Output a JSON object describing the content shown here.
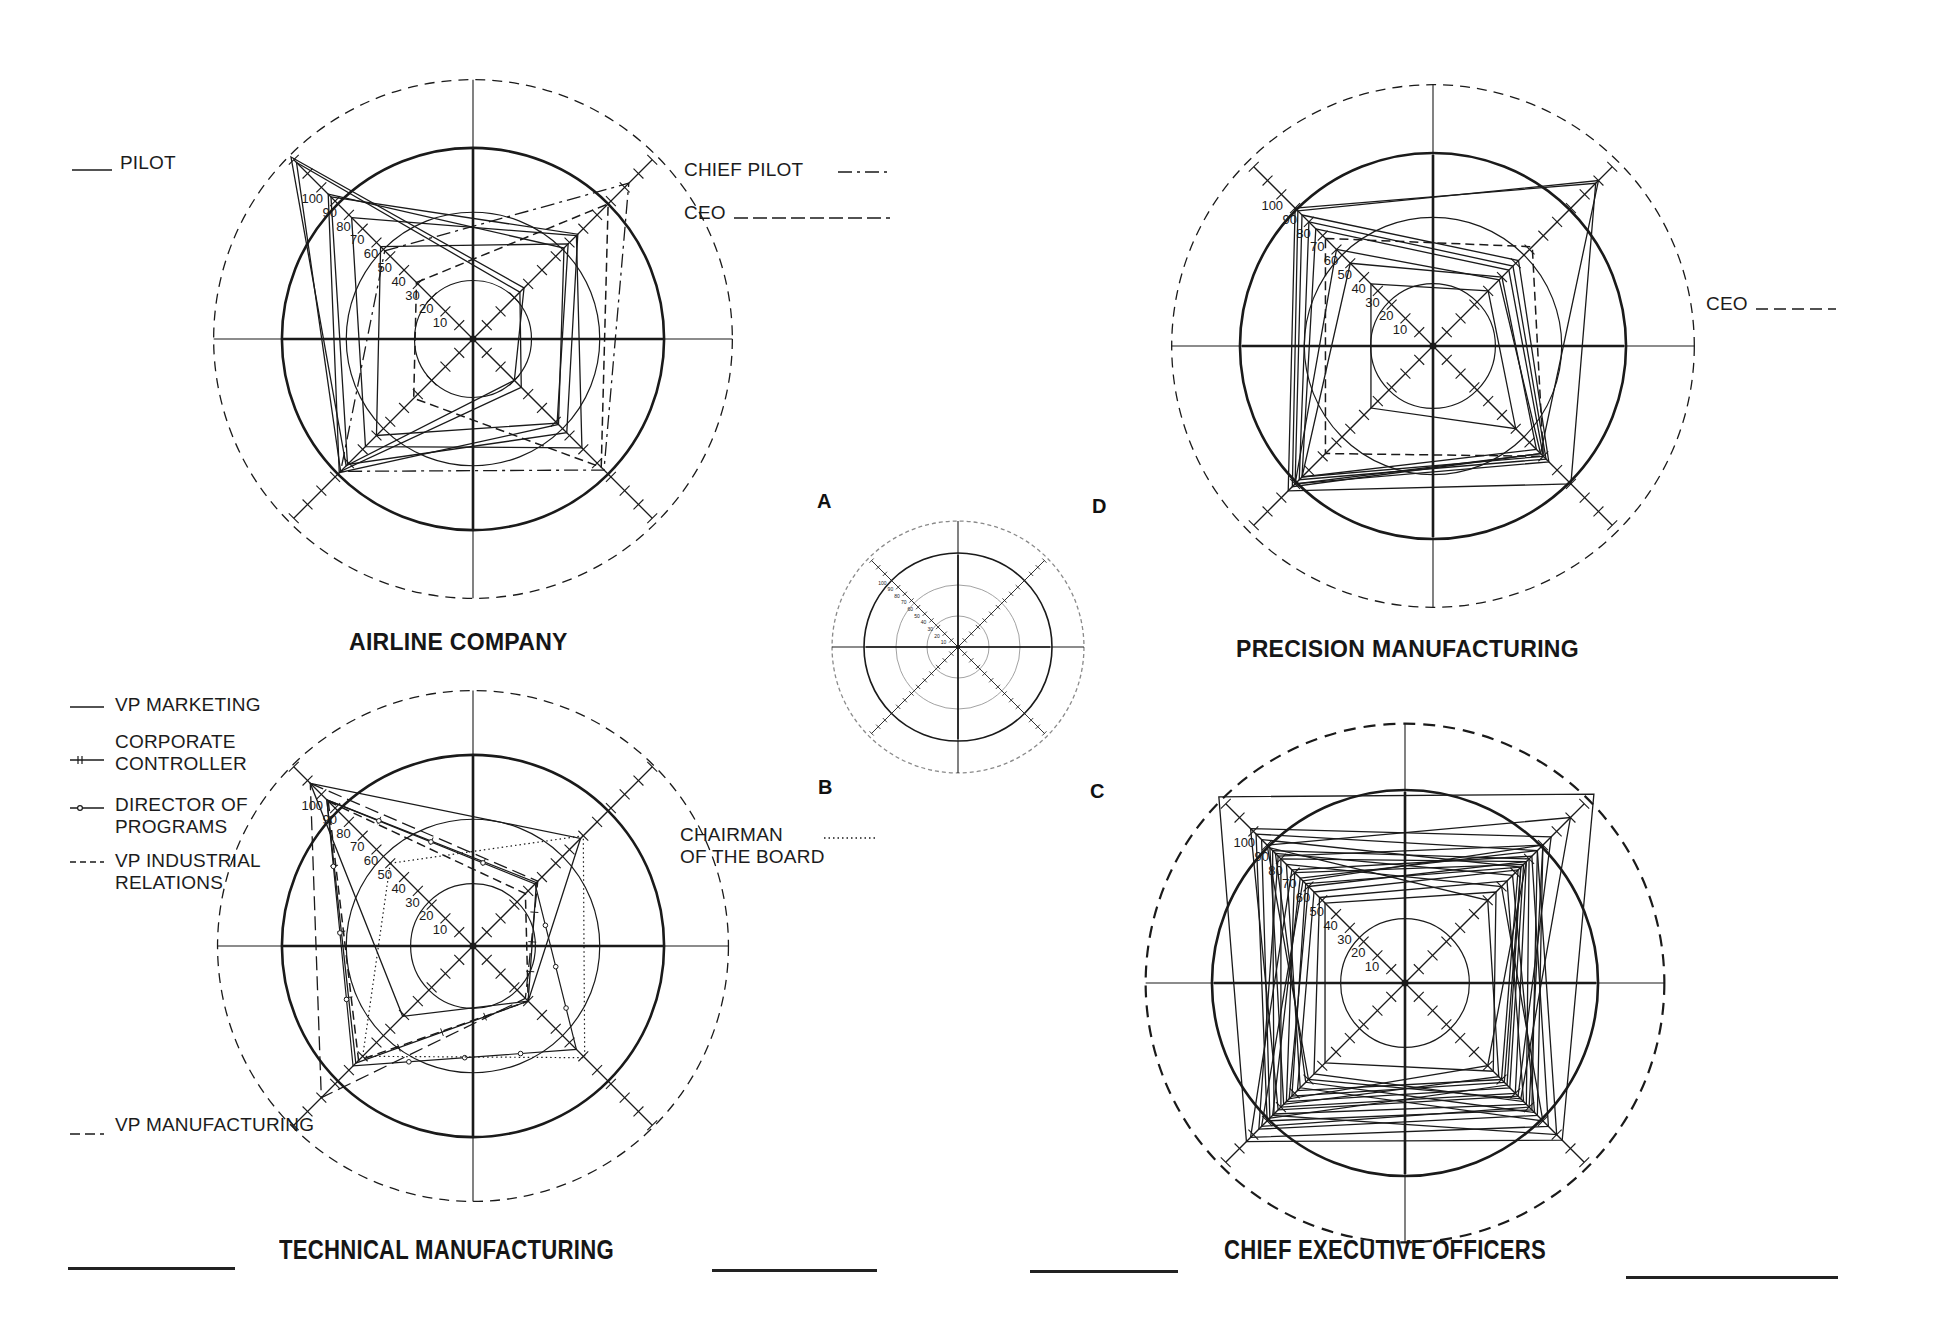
{
  "figure": {
    "panel_letters": {
      "a": "A",
      "b": "B",
      "c": "C",
      "d": "D"
    },
    "titles": {
      "airline": "AIRLINE COMPANY",
      "precision": "PRECISION MANUFACTURING",
      "technical": "TECHNICAL MANUFACTURING",
      "ceos": "CHIEF EXECUTIVE OFFICERS"
    },
    "legends": {
      "airline": [
        {
          "label": "PILOT",
          "style": "solid"
        },
        {
          "label": "CHIEF PILOT",
          "style": "dash-dot"
        },
        {
          "label": "CEO",
          "style": "dashed"
        }
      ],
      "precision": [
        {
          "label": "CEO",
          "style": "dashed"
        }
      ],
      "technical": [
        {
          "label": "VP MARKETING",
          "style": "solid"
        },
        {
          "label": "CORPORATE",
          "label2": "CONTROLLER",
          "style": "tick-line"
        },
        {
          "label": "DIRECTOR OF",
          "label2": "PROGRAMS",
          "style": "dot-line"
        },
        {
          "label": "VP INDUSTRIAL",
          "label2": "RELATIONS",
          "style": "dashed"
        },
        {
          "label": "CHAIRMAN",
          "label2": "OF THE BOARD",
          "style": "dotted"
        },
        {
          "label": "VP MANUFACTURING",
          "style": "long-dash"
        }
      ]
    },
    "axis_tick_labels": [
      "10",
      "20",
      "30",
      "40",
      "50",
      "60",
      "70",
      "80",
      "90",
      "100"
    ],
    "colors": {
      "ink": "#1a1a1a",
      "light_ink": "#8a8a8a",
      "background": "#ffffff"
    }
  },
  "chart_data": [
    {
      "id": "A",
      "type": "radar",
      "title": "AIRLINE COMPANY",
      "axes": [
        "NW",
        "NE",
        "SE",
        "SW"
      ],
      "scale": {
        "min": 0,
        "max": 130,
        "tick_step": 10,
        "labeled_ticks": [
          10,
          20,
          30,
          40,
          50,
          60,
          70,
          80,
          90,
          100
        ]
      },
      "rings": [
        30,
        65,
        98,
        133
      ],
      "series": [
        {
          "name": "PILOT",
          "style": "solid",
          "values": [
            103,
            76,
            68,
            91
          ]
        },
        {
          "name": "PILOT",
          "style": "solid",
          "values": [
            105,
            66,
            62,
            97
          ]
        },
        {
          "name": "PILOT",
          "style": "solid",
          "values": [
            132,
            37,
            30,
            92
          ]
        },
        {
          "name": "PILOT",
          "style": "solid",
          "values": [
            128,
            34,
            35,
            96
          ]
        },
        {
          "name": "PILOT",
          "style": "solid",
          "values": [
            88,
            75,
            79,
            78
          ]
        },
        {
          "name": "PILOT",
          "style": "solid",
          "values": [
            67,
            69,
            61,
            70
          ]
        },
        {
          "name": "CHIEF PILOT",
          "style": "dash-dot",
          "values": [
            64,
            113,
            95,
            96
          ]
        },
        {
          "name": "CEO",
          "style": "dashed",
          "values": [
            41,
            98,
            93,
            43
          ]
        }
      ]
    },
    {
      "id": "B",
      "type": "radar",
      "title": "TECHNICAL MANUFACTURING",
      "axes": [
        "NW",
        "NE",
        "SE",
        "SW"
      ],
      "scale": {
        "min": 0,
        "max": 130,
        "tick_step": 10,
        "labeled_ticks": [
          10,
          20,
          30,
          40,
          50,
          60,
          70,
          80,
          90,
          100
        ]
      },
      "rings": [
        32,
        65,
        98,
        131
      ],
      "series": [
        {
          "name": "VP MARKETING",
          "style": "solid",
          "values": [
            118,
            78,
            40,
            51
          ]
        },
        {
          "name": "CORPORATE CONTROLLER",
          "style": "tick-line",
          "values": [
            106,
            46,
            40,
            85
          ]
        },
        {
          "name": "DIRECTOR OF PROGRAMS",
          "style": "dot-line",
          "values": [
            106,
            45,
            75,
            87
          ]
        },
        {
          "name": "VP INDUSTRIAL RELATIONS",
          "style": "dashed",
          "values": [
            105,
            38,
            40,
            83
          ]
        },
        {
          "name": "CHAIRMAN OF THE BOARD",
          "style": "dotted",
          "values": [
            60,
            80,
            81,
            80
          ]
        },
        {
          "name": "VP MANUFACTURING",
          "style": "long-dash",
          "values": [
            118,
            47,
            38,
            110
          ]
        }
      ]
    },
    {
      "id": "D",
      "type": "radar",
      "title": "PRECISION MANUFACTURING",
      "axes": [
        "NW",
        "NE",
        "SE",
        "SW"
      ],
      "scale": {
        "min": 0,
        "max": 130,
        "tick_step": 10,
        "labeled_ticks": [
          10,
          20,
          30,
          40,
          50,
          60,
          70,
          80,
          90,
          100
        ]
      },
      "rings": [
        32,
        66,
        99,
        134
      ],
      "series": [
        {
          "name": "MANAGER",
          "style": "solid",
          "values": [
            100,
            118,
            100,
            105
          ]
        },
        {
          "name": "MANAGER",
          "style": "solid",
          "values": [
            95,
            62,
            84,
            100
          ]
        },
        {
          "name": "MANAGER",
          "style": "solid",
          "values": [
            90,
            58,
            82,
            97
          ]
        },
        {
          "name": "MANAGER",
          "style": "solid",
          "values": [
            85,
            55,
            80,
            95
          ]
        },
        {
          "name": "MANAGER",
          "style": "solid",
          "values": [
            70,
            48,
            78,
            100
          ]
        },
        {
          "name": "MANAGER",
          "style": "solid",
          "values": [
            60,
            50,
            75,
            95
          ]
        },
        {
          "name": "MANAGER",
          "style": "solid",
          "values": [
            45,
            40,
            60,
            45
          ]
        },
        {
          "name": "MANAGER",
          "style": "solid",
          "values": [
            98,
            120,
            78,
            102
          ]
        },
        {
          "name": "CEO",
          "style": "dashed",
          "values": [
            78,
            72,
            80,
            78
          ]
        }
      ]
    },
    {
      "id": "C",
      "type": "radar",
      "title": "CHIEF EXECUTIVE OFFICERS",
      "axes": [
        "NW",
        "NE",
        "SE",
        "SW"
      ],
      "scale": {
        "min": 0,
        "max": 130,
        "tick_step": 10,
        "labeled_ticks": [
          10,
          20,
          30,
          40,
          50,
          60,
          70,
          80,
          90,
          100
        ]
      },
      "rings": [
        33,
        99,
        133
      ],
      "series": [
        {
          "name": "CEO",
          "style": "solid",
          "values": [
            135,
            137,
            114,
            115
          ]
        },
        {
          "name": "CEO",
          "style": "solid",
          "values": [
            108,
            96,
            92,
            100
          ]
        },
        {
          "name": "CEO",
          "style": "solid",
          "values": [
            96,
            90,
            88,
            95
          ]
        },
        {
          "name": "CEO",
          "style": "solid",
          "values": [
            90,
            88,
            80,
            90
          ]
        },
        {
          "name": "CEO",
          "style": "solid",
          "values": [
            80,
            86,
            76,
            86
          ]
        },
        {
          "name": "CEO",
          "style": "solid",
          "values": [
            72,
            84,
            72,
            82
          ]
        },
        {
          "name": "CEO",
          "style": "solid",
          "values": [
            66,
            82,
            70,
            78
          ]
        },
        {
          "name": "CEO",
          "style": "solid",
          "values": [
            98,
            60,
            68,
            88
          ]
        },
        {
          "name": "CEO",
          "style": "solid",
          "values": [
            86,
            70,
            100,
            76
          ]
        },
        {
          "name": "CEO",
          "style": "solid",
          "values": [
            100,
            120,
            84,
            70
          ]
        },
        {
          "name": "CEO",
          "style": "solid",
          "values": [
            76,
            96,
            110,
            96
          ]
        },
        {
          "name": "CEO",
          "style": "solid",
          "values": [
            92,
            100,
            96,
            106
          ]
        },
        {
          "name": "CEO",
          "style": "solid",
          "values": [
            62,
            74,
            86,
            66
          ]
        },
        {
          "name": "CEO",
          "style": "solid",
          "values": [
            104,
            84,
            74,
            98
          ]
        },
        {
          "name": "CEO",
          "style": "solid",
          "values": [
            70,
            88,
            60,
            84
          ]
        },
        {
          "name": "CEO",
          "style": "solid",
          "values": [
            82,
            92,
            104,
            112
          ]
        },
        {
          "name": "CEO",
          "style": "solid",
          "values": [
            94,
            78,
            94,
            72
          ]
        },
        {
          "name": "CEO",
          "style": "solid",
          "values": [
            58,
            66,
            64,
            58
          ]
        },
        {
          "name": "CEO",
          "style": "solid",
          "values": [
            112,
            106,
            82,
            92
          ]
        },
        {
          "name": "CEO",
          "style": "solid",
          "values": [
            74,
            100,
            90,
            104
          ]
        }
      ]
    },
    {
      "id": "key",
      "type": "radar",
      "title": "",
      "axes": [
        "NW",
        "NE",
        "SE",
        "SW"
      ],
      "scale": {
        "min": 0,
        "max": 130,
        "tick_step": 10,
        "labeled_ticks": [
          10,
          20,
          30,
          40,
          50,
          60,
          70,
          80,
          90,
          100
        ]
      },
      "rings": [
        33,
        66,
        100,
        134
      ],
      "series": []
    }
  ]
}
